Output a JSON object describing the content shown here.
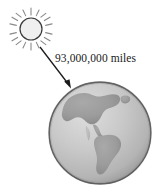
{
  "figure": {
    "background_color": "#ffffff",
    "width": 164,
    "height": 189
  },
  "sun": {
    "name": "Sun",
    "center_x": 31,
    "center_y": 29,
    "radius": 11,
    "ray_count": 16,
    "ray_inner_radius": 14,
    "ray_outer_radius": 21,
    "fill_color": "#efefef",
    "outline_color": "#3a3a3a",
    "ray_color": "#8a8a8a"
  },
  "earth": {
    "name": "Earth",
    "center_x": 100,
    "center_y": 133,
    "radius": 51,
    "ocean_color_light": "#d2d2d2",
    "ocean_color_dark": "#9a9a9a",
    "land_color": "#9d9d9d",
    "outline_color": "#6e6e6e",
    "continents_depicted": "North America, Central America, South America"
  },
  "arrow": {
    "name": "distance arrow",
    "from_x": 40,
    "from_y": 47,
    "to_x": 71,
    "to_y": 88,
    "color": "#1a1a1a",
    "head": "filled triangle"
  },
  "label": {
    "distance_text": "93,000,000 miles",
    "color": "#1a1a1a"
  }
}
